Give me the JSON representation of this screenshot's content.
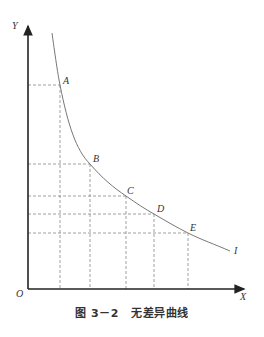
{
  "figure": {
    "axes": {
      "x_label": "X",
      "y_label": "Y",
      "origin_label": "O"
    },
    "curve_label": "I",
    "points": [
      {
        "label": "A",
        "x": 60,
        "y": 85
      },
      {
        "label": "B",
        "x": 90,
        "y": 164
      },
      {
        "label": "C",
        "x": 126,
        "y": 196
      },
      {
        "label": "D",
        "x": 154,
        "y": 214
      },
      {
        "label": "E",
        "x": 188,
        "y": 233
      }
    ],
    "caption": {
      "number": "图 3－2",
      "title": "无差异曲线"
    }
  },
  "colors": {
    "axis": "#333333",
    "curve": "#777777",
    "dash": "#888888"
  }
}
